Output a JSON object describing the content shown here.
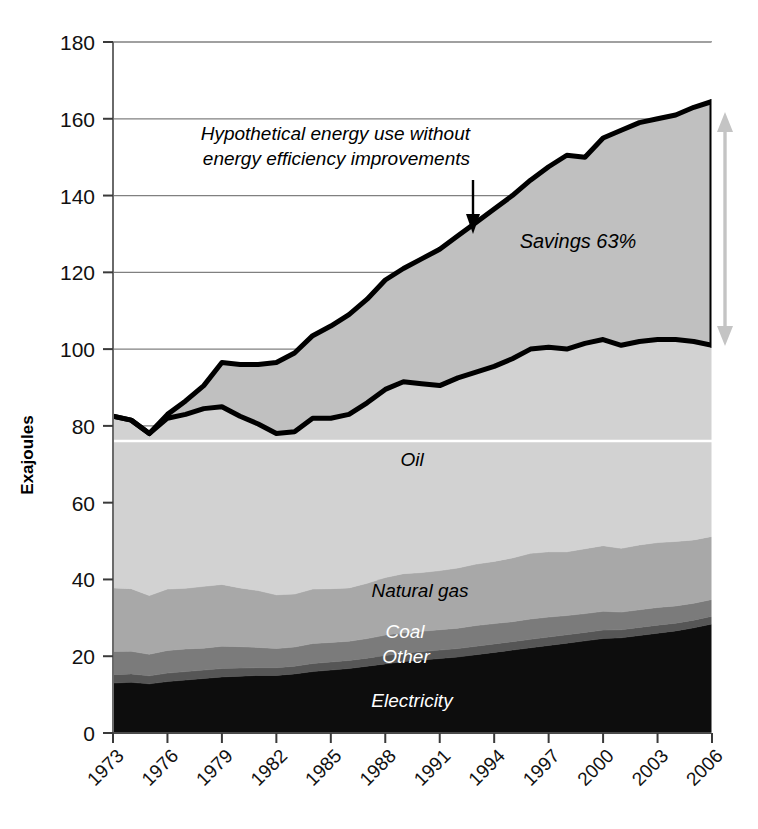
{
  "chart_data": {
    "type": "area",
    "title": "",
    "xlabel": "",
    "ylabel": "Exajoules",
    "ylim": [
      0,
      180
    ],
    "xlim": [
      1973,
      2006
    ],
    "grid": true,
    "legend_position": "inline-labels",
    "y_ticks": [
      "0",
      "20",
      "40",
      "60",
      "80",
      "100",
      "120",
      "140",
      "160",
      "180"
    ],
    "x_ticks": [
      "1973",
      "1976",
      "1979",
      "1982",
      "1985",
      "1988",
      "1991",
      "1994",
      "1997",
      "2000",
      "2003",
      "2006"
    ],
    "x": [
      1973,
      1974,
      1975,
      1976,
      1977,
      1978,
      1979,
      1980,
      1981,
      1982,
      1983,
      1984,
      1985,
      1986,
      1987,
      1988,
      1989,
      1990,
      1991,
      1992,
      1993,
      1994,
      1995,
      1996,
      1997,
      1998,
      1999,
      2000,
      2001,
      2002,
      2003,
      2004,
      2005,
      2006
    ],
    "series": [
      {
        "name": "Hypothetical energy use without energy efficiency improvements",
        "kind": "line",
        "color": "#000000",
        "values": [
          82.5,
          81.5,
          78.0,
          83.0,
          86.5,
          90.5,
          96.5,
          96.0,
          96.0,
          96.5,
          99.0,
          103.5,
          106.0,
          109.0,
          113.0,
          118.0,
          121.0,
          123.5,
          126.0,
          129.5,
          133.0,
          136.5,
          140.0,
          144.0,
          147.5,
          150.5,
          150.0,
          155.0,
          157.0,
          159.0,
          160.0,
          161.0,
          163.0,
          164.5
        ]
      },
      {
        "name": "Actual energy use",
        "kind": "line",
        "color": "#000000",
        "values": [
          82.5,
          81.5,
          78.0,
          82.0,
          83.0,
          84.5,
          85.0,
          82.5,
          80.5,
          78.0,
          78.5,
          82.0,
          82.0,
          83.0,
          86.0,
          89.5,
          91.5,
          91.0,
          90.5,
          92.5,
          94.0,
          95.5,
          97.5,
          100.0,
          100.5,
          100.0,
          101.5,
          102.5,
          101.0,
          102.0,
          102.5,
          102.5,
          102.0,
          101.0
        ]
      },
      {
        "name": "Electricity",
        "kind": "stacked-area",
        "color": "#0d0d0d",
        "values": [
          13.0,
          13.2,
          12.8,
          13.4,
          13.8,
          14.2,
          14.6,
          14.8,
          15.0,
          15.0,
          15.4,
          16.0,
          16.4,
          16.8,
          17.4,
          18.0,
          18.6,
          19.0,
          19.4,
          19.8,
          20.4,
          21.0,
          21.6,
          22.2,
          22.8,
          23.4,
          24.0,
          24.6,
          24.8,
          25.4,
          26.0,
          26.6,
          27.4,
          28.4
        ]
      },
      {
        "name": "Other",
        "kind": "stacked-area",
        "color": "#565656",
        "values": [
          2.2,
          2.2,
          2.1,
          2.2,
          2.2,
          2.2,
          2.2,
          2.1,
          2.0,
          2.0,
          2.0,
          2.1,
          2.1,
          2.1,
          2.1,
          2.2,
          2.2,
          2.2,
          2.2,
          2.2,
          2.2,
          2.2,
          2.2,
          2.2,
          2.2,
          2.2,
          2.2,
          2.2,
          2.1,
          2.1,
          2.1,
          2.0,
          2.0,
          2.0
        ]
      },
      {
        "name": "Coal",
        "kind": "stacked-area",
        "color": "#7b7b7b",
        "values": [
          6.0,
          5.9,
          5.6,
          5.9,
          5.9,
          5.7,
          5.8,
          5.6,
          5.3,
          5.0,
          5.0,
          5.2,
          5.1,
          5.0,
          5.1,
          5.3,
          5.3,
          5.3,
          5.3,
          5.3,
          5.4,
          5.3,
          5.2,
          5.3,
          5.2,
          5.0,
          4.9,
          4.9,
          4.6,
          4.6,
          4.6,
          4.5,
          4.4,
          4.4
        ]
      },
      {
        "name": "Natural gas",
        "kind": "stacked-area",
        "color": "#a8a8a8",
        "values": [
          16.6,
          16.3,
          15.3,
          16.0,
          15.8,
          16.1,
          16.1,
          15.3,
          14.8,
          14.0,
          13.8,
          14.2,
          14.0,
          13.9,
          14.4,
          15.0,
          15.4,
          15.3,
          15.4,
          15.7,
          16.0,
          16.2,
          16.6,
          17.1,
          17.0,
          16.6,
          16.9,
          17.1,
          16.6,
          16.9,
          16.9,
          16.8,
          16.5,
          16.4
        ]
      },
      {
        "name": "Oil",
        "kind": "stacked-area",
        "color": "#d2d2d2",
        "values": [
          44.7,
          43.9,
          42.2,
          44.5,
          45.3,
          46.3,
          46.3,
          44.7,
          43.4,
          42.0,
          42.3,
          44.5,
          44.4,
          45.2,
          47.0,
          49.0,
          50.0,
          49.2,
          48.2,
          49.5,
          50.0,
          50.8,
          51.9,
          53.2,
          53.3,
          52.8,
          53.5,
          53.7,
          52.9,
          53.0,
          52.9,
          52.6,
          51.7,
          49.8
        ]
      }
    ],
    "annotations": [
      {
        "name": "hypothetical-annotation",
        "line1": "Hypothetical energy use without",
        "line2": "energy efficiency improvements"
      },
      {
        "name": "savings-annotation",
        "text": "Savings 63%"
      }
    ],
    "inline_labels": [
      {
        "name": "oil",
        "text": "Oil",
        "style": "dark"
      },
      {
        "name": "natural-gas",
        "text": "Natural gas",
        "style": "dark"
      },
      {
        "name": "coal",
        "text": "Coal",
        "style": "light"
      },
      {
        "name": "other",
        "text": "Other",
        "style": "light"
      },
      {
        "name": "electricity",
        "text": "Electricity",
        "style": "light"
      }
    ],
    "colors": {
      "oil": "#d2d2d2",
      "natural_gas": "#a8a8a8",
      "coal": "#7b7b7b",
      "other": "#565656",
      "electricity": "#0d0d0d",
      "savings_fill": "#c0c0c0",
      "curve": "#000000",
      "grid": "#808080",
      "arrow": "#c4c4c4"
    }
  }
}
